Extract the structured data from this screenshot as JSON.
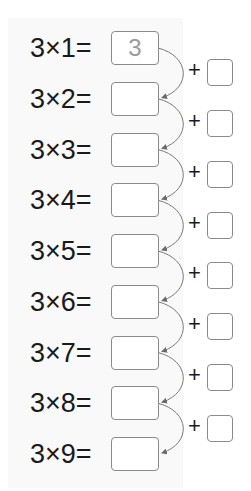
{
  "worksheet": {
    "rows": [
      {
        "expr": "3×1=",
        "answer": "3"
      },
      {
        "expr": "3×2=",
        "answer": ""
      },
      {
        "expr": "3×3=",
        "answer": ""
      },
      {
        "expr": "3×4=",
        "answer": ""
      },
      {
        "expr": "3×5=",
        "answer": ""
      },
      {
        "expr": "3×6=",
        "answer": ""
      },
      {
        "expr": "3×7=",
        "answer": ""
      },
      {
        "expr": "3×8=",
        "answer": ""
      },
      {
        "expr": "3×9=",
        "answer": ""
      }
    ],
    "steps": [
      {
        "op": "+",
        "value": ""
      },
      {
        "op": "+",
        "value": ""
      },
      {
        "op": "+",
        "value": ""
      },
      {
        "op": "+",
        "value": ""
      },
      {
        "op": "+",
        "value": ""
      },
      {
        "op": "+",
        "value": ""
      },
      {
        "op": "+",
        "value": ""
      },
      {
        "op": "+",
        "value": ""
      }
    ],
    "colors": {
      "text": "#1a1a1a",
      "border": "#8a8a8a",
      "prefilled": "#9a9a9a"
    }
  }
}
